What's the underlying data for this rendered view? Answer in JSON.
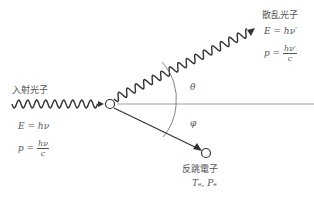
{
  "incident_photon": {
    "label": "入射光子",
    "energy": "E = hν",
    "momentum_lhs": "p =",
    "momentum_num": "hν",
    "momentum_den": "c"
  },
  "scattered_photon": {
    "label": "散乱光子",
    "energy": "E = hν′",
    "momentum_lhs": "p =",
    "momentum_num": "hν′",
    "momentum_den": "c"
  },
  "recoil_electron": {
    "label": "反跳電子",
    "quantities": "Tₑ, Pₑ"
  },
  "angles": {
    "theta": "θ",
    "phi": "φ"
  }
}
